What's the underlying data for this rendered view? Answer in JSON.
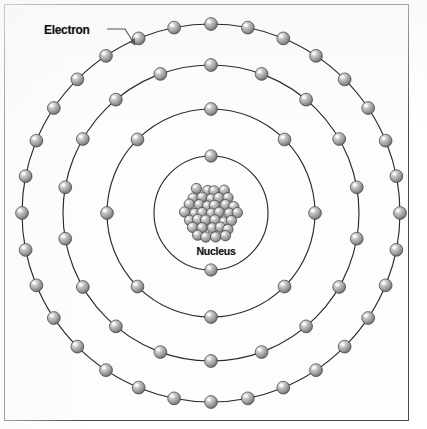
{
  "figure": {
    "background_color": "#ffffff",
    "frame_color": "#4a4a4a"
  },
  "labels": {
    "electron": "Electron",
    "nucleus": "Nucleus"
  },
  "credit": {
    "text": ""
  },
  "colors": {
    "orbit_line": "#2b2b2b",
    "electron_light": "#e8e8e8",
    "electron_mid": "#9a9a9a",
    "electron_dark": "#5f5f5f",
    "electron_outline": "#3d3d3d",
    "nucleon_light": "#ededed",
    "nucleon_mid": "#a0a0a0",
    "nucleon_dark": "#666666",
    "label_text": "#111111",
    "leader_line": "#555555"
  },
  "chart_data": {
    "type": "diagram",
    "center": {
      "x": 211,
      "y": 213
    },
    "nucleus": {
      "label": "Nucleus",
      "radius": 33,
      "nucleon_radius": 5.2,
      "nucleon_count": 37
    },
    "shells": [
      {
        "name": "shell-1",
        "shell_number": 1,
        "radius": 57,
        "electron_count": 2,
        "start_angle": -90,
        "electron_radius": 6.2
      },
      {
        "name": "shell-2",
        "shell_number": 2,
        "radius": 104,
        "electron_count": 8,
        "start_angle": -90,
        "electron_radius": 6.4
      },
      {
        "name": "shell-3",
        "shell_number": 3,
        "radius": 148,
        "electron_count": 18,
        "start_angle": -90,
        "electron_radius": 6.4
      },
      {
        "name": "shell-4",
        "shell_number": 4,
        "radius": 189,
        "electron_count": 32,
        "start_angle": -90,
        "electron_radius": 6.4
      }
    ],
    "total_electrons": 60,
    "callout": {
      "label": "Electron",
      "text_x": 44,
      "text_y": 32,
      "leader_from": {
        "x": 107,
        "y": 29
      },
      "leader_to": {
        "x": 135,
        "y": 45
      },
      "target_shell": 4
    }
  }
}
